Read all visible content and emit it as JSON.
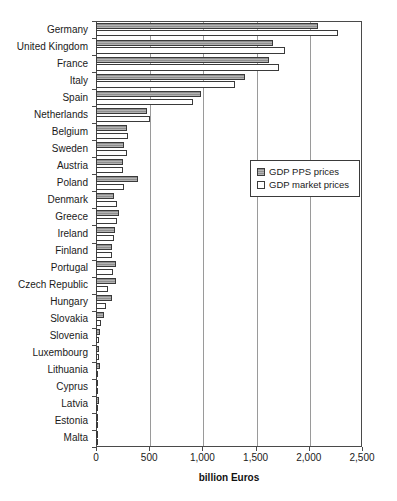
{
  "chart_data": {
    "type": "bar",
    "orientation": "horizontal",
    "title": "",
    "xlabel": "billion Euros",
    "ylabel": "",
    "xlim": [
      0,
      2500
    ],
    "xticks": [
      0,
      500,
      1000,
      1500,
      2000,
      2500
    ],
    "xticklabels": [
      "0",
      "500",
      "1,000",
      "1,500",
      "2,000",
      "2,500"
    ],
    "grid": "vertical",
    "legend_position": "center-right",
    "categories": [
      "Germany",
      "United Kingdom",
      "France",
      "Italy",
      "Spain",
      "Netherlands",
      "Belgium",
      "Sweden",
      "Austria",
      "Poland",
      "Denmark",
      "Greece",
      "Ireland",
      "Finland",
      "Portugal",
      "Czech Republic",
      "Hungary",
      "Slovakia",
      "Slovenia",
      "Luxembourg",
      "Lithuania",
      "Cyprus",
      "Latvia",
      "Estonia",
      "Malta"
    ],
    "series": [
      {
        "name": "GDP PPS prices",
        "color": "#8f8f8f",
        "values": [
          2090,
          1665,
          1625,
          1400,
          985,
          480,
          295,
          265,
          250,
          395,
          165,
          215,
          175,
          150,
          190,
          190,
          155,
          75,
          40,
          28,
          42,
          15,
          27,
          18,
          8
        ]
      },
      {
        "name": "GDP market prices",
        "color": "#ffffff",
        "values": [
          2270,
          1780,
          1720,
          1310,
          910,
          510,
          300,
          290,
          255,
          265,
          195,
          195,
          165,
          155,
          160,
          110,
          90,
          45,
          30,
          30,
          22,
          14,
          16,
          12,
          5
        ]
      }
    ]
  },
  "legend": {
    "items": [
      {
        "label": "GDP PPS prices",
        "marker": "filled-hatched-square"
      },
      {
        "label": "GDP market prices",
        "marker": "open-square"
      }
    ]
  },
  "axis": {
    "x_title": "billion Euros"
  }
}
